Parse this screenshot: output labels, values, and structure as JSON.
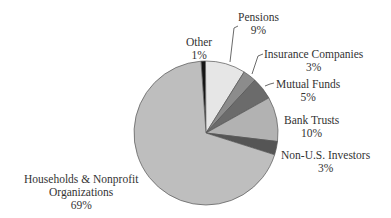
{
  "chart_data": {
    "type": "pie",
    "title": "",
    "start_angle_deg": -4,
    "direction": "clockwise",
    "slices": [
      {
        "label": "Other",
        "value": 1,
        "pct_label": "1%",
        "color": "#151515"
      },
      {
        "label": "Pensions",
        "value": 9,
        "pct_label": "9%",
        "color": "#e6e6e6"
      },
      {
        "label": "Insurance Companies",
        "value": 3,
        "pct_label": "3%",
        "color": "#8c8c8c"
      },
      {
        "label": "Mutual Funds",
        "value": 5,
        "pct_label": "5%",
        "color": "#6b6b6b"
      },
      {
        "label": "Bank Trusts",
        "value": 10,
        "pct_label": "10%",
        "color": "#b2b2b2"
      },
      {
        "label": "Non-U.S. Investors",
        "value": 3,
        "pct_label": "3%",
        "color": "#555555"
      },
      {
        "label": "Households & Nonprofit Organizations",
        "label_lines": [
          "Households & Nonprofit",
          "Organizations"
        ],
        "value": 69,
        "pct_label": "69%",
        "color": "#bebebe"
      }
    ]
  },
  "labels": {
    "other": {
      "name": "Other",
      "pct": "1%"
    },
    "pensions": {
      "name": "Pensions",
      "pct": "9%"
    },
    "insurance": {
      "name": "Insurance Companies",
      "pct": "3%"
    },
    "mutual": {
      "name": "Mutual Funds",
      "pct": "5%"
    },
    "bank": {
      "name": "Bank Trusts",
      "pct": "10%"
    },
    "nonus": {
      "name": "Non-U.S. Investors",
      "pct": "3%"
    },
    "households": {
      "line1": "Households & Nonprofit",
      "line2": "Organizations",
      "pct": "69%"
    }
  }
}
